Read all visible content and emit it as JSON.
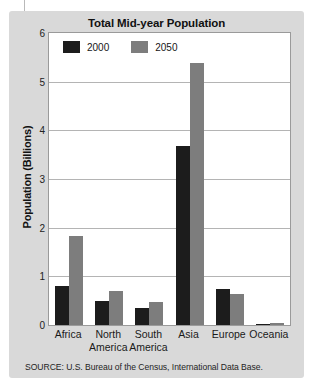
{
  "figure": {
    "title": "Total Mid-year Population",
    "source": "SOURCE: U.S. Bureau of the Census, International Data Base.",
    "background_color": "#d9d9d9",
    "plot_background_color": "#ffffff"
  },
  "legend": {
    "position": "top-left-inside",
    "items": [
      {
        "label": "2000",
        "color": "#1c1c1c",
        "swatch_name": "legend-swatch-2000"
      },
      {
        "label": "2050",
        "color": "#7d7d7d",
        "swatch_name": "legend-swatch-2050"
      }
    ]
  },
  "chart_data": {
    "type": "bar",
    "title": "Total Mid-year Population",
    "xlabel": "",
    "ylabel": "Population (Billions)",
    "ylim": [
      0,
      6
    ],
    "yticks": [
      0,
      1,
      2,
      3,
      4,
      5,
      6
    ],
    "ytick_labels": [
      "0",
      "1",
      "2",
      "3",
      "4",
      "5",
      "6"
    ],
    "grid": true,
    "grid_axis": "y",
    "categories": [
      "Africa",
      "North America",
      "South America",
      "Asia",
      "Europe",
      "Oceania"
    ],
    "category_lines": [
      [
        "Africa"
      ],
      [
        "North",
        "America"
      ],
      [
        "South",
        "America"
      ],
      [
        "Asia"
      ],
      [
        "Europe"
      ],
      [
        "Oceania"
      ]
    ],
    "series": [
      {
        "name": "2000",
        "color": "#1c1c1c",
        "values": [
          0.8,
          0.49,
          0.35,
          3.68,
          0.73,
          0.03
        ]
      },
      {
        "name": "2050",
        "color": "#7d7d7d",
        "values": [
          1.83,
          0.7,
          0.47,
          5.38,
          0.63,
          0.05
        ]
      }
    ],
    "legend": [
      "2000",
      "2050"
    ],
    "source_note": "SOURCE: U.S. Bureau of the Census, International Data Base."
  }
}
